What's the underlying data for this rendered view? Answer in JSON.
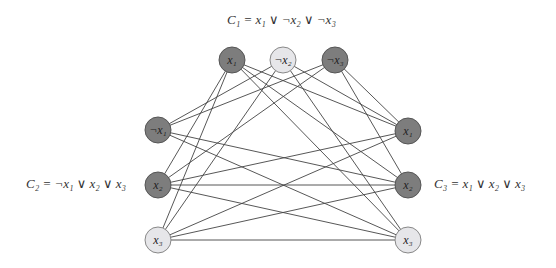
{
  "clauses": [
    {
      "id": "C1",
      "label": "C₁ = x₁ ∨ ¬x₂ ∨ ¬x₃"
    },
    {
      "id": "C2",
      "label": "C₂ = ¬x₁ ∨ x₂ ∨ x₃"
    },
    {
      "id": "C3",
      "label": "C₃ = x₁ ∨ x₂ ∨ x₃"
    }
  ],
  "nodes": [
    {
      "id": "c1a",
      "clause": "C1",
      "label": "x₁",
      "x": 232,
      "y": 60,
      "shade": "dark"
    },
    {
      "id": "c1b",
      "clause": "C1",
      "label": "¬x₂",
      "x": 283,
      "y": 60,
      "shade": "light"
    },
    {
      "id": "c1c",
      "clause": "C1",
      "label": "¬x₃",
      "x": 335,
      "y": 60,
      "shade": "dark"
    },
    {
      "id": "c2a",
      "clause": "C2",
      "label": "¬x₁",
      "x": 158,
      "y": 130,
      "shade": "dark"
    },
    {
      "id": "c2b",
      "clause": "C2",
      "label": "x₂",
      "x": 158,
      "y": 185,
      "shade": "dark"
    },
    {
      "id": "c2c",
      "clause": "C2",
      "label": "x₃",
      "x": 158,
      "y": 240,
      "shade": "light"
    },
    {
      "id": "c3a",
      "clause": "C3",
      "label": "x₁",
      "x": 408,
      "y": 131,
      "shade": "dark"
    },
    {
      "id": "c3b",
      "clause": "C3",
      "label": "x₂",
      "x": 408,
      "y": 185,
      "shade": "dark"
    },
    {
      "id": "c3c",
      "clause": "C3",
      "label": "x₃",
      "x": 408,
      "y": 240,
      "shade": "light"
    }
  ],
  "edges": [
    [
      "c1a",
      "c2b"
    ],
    [
      "c1a",
      "c2c"
    ],
    [
      "c1a",
      "c3a"
    ],
    [
      "c1a",
      "c3b"
    ],
    [
      "c1a",
      "c3c"
    ],
    [
      "c1b",
      "c2a"
    ],
    [
      "c1b",
      "c2c"
    ],
    [
      "c1b",
      "c3a"
    ],
    [
      "c1b",
      "c3c"
    ],
    [
      "c1c",
      "c2a"
    ],
    [
      "c1c",
      "c2b"
    ],
    [
      "c1c",
      "c3a"
    ],
    [
      "c1c",
      "c3b"
    ],
    [
      "c2a",
      "c3b"
    ],
    [
      "c2a",
      "c3c"
    ],
    [
      "c2b",
      "c3a"
    ],
    [
      "c2b",
      "c3b"
    ],
    [
      "c2b",
      "c3c"
    ],
    [
      "c2c",
      "c3a"
    ],
    [
      "c2c",
      "c3b"
    ],
    [
      "c2c",
      "c3c"
    ]
  ],
  "node_radius": 13,
  "colors": {
    "dark_node": "#7d7d7d",
    "light_node": "#e6e6e9",
    "edge": "#444444"
  }
}
